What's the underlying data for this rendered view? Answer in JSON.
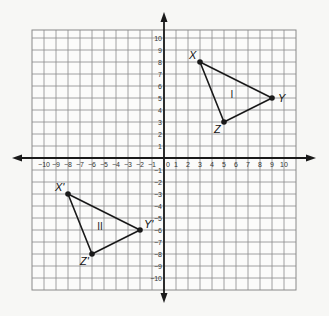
{
  "diagram": {
    "type": "coordinate-plane",
    "x_ticks": [
      -10,
      -9,
      -8,
      -7,
      -6,
      -5,
      -4,
      -3,
      -2,
      -1,
      1,
      2,
      3,
      4,
      5,
      6,
      7,
      8,
      9,
      10
    ],
    "y_ticks": [
      -10,
      -9,
      -8,
      -7,
      -6,
      -5,
      -4,
      -3,
      -2,
      -1,
      1,
      2,
      3,
      4,
      5,
      6,
      7,
      8,
      9,
      10
    ],
    "origin_label": "0",
    "triangles": [
      {
        "name": "I",
        "points": [
          {
            "label": "X",
            "x": 3,
            "y": 8
          },
          {
            "label": "Y",
            "x": 9,
            "y": 5
          },
          {
            "label": "Z",
            "x": 5,
            "y": 3
          }
        ]
      },
      {
        "name": "II",
        "points": [
          {
            "label": "X'",
            "x": -8,
            "y": -3
          },
          {
            "label": "Y'",
            "x": -2,
            "y": -6
          },
          {
            "label": "Z'",
            "x": -6,
            "y": -8
          }
        ]
      }
    ],
    "colors": {
      "grid": "#8a8a8a",
      "axis": "#1a1a1a",
      "triangle": "#1a1a1a",
      "background": "#f7f7f5"
    }
  }
}
